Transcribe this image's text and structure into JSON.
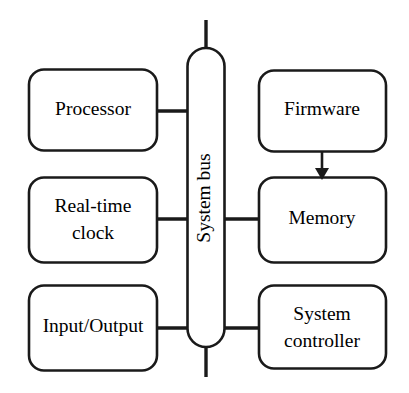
{
  "diagram": {
    "colors": {
      "stroke": "#1a1a1a",
      "fill": "#ffffff",
      "text": "#000000",
      "background": "#ffffff"
    },
    "bus": {
      "label": "System bus",
      "orientation": "vertical",
      "label_rotation_degrees": -90
    },
    "nodes": {
      "processor": {
        "label": "Processor",
        "side": "left",
        "row": 1
      },
      "real_time_clock": {
        "label_line1": "Real-time",
        "label_line2": "clock",
        "side": "left",
        "row": 2
      },
      "input_output": {
        "label": "Input/Output",
        "side": "left",
        "row": 3
      },
      "firmware": {
        "label": "Firmware",
        "side": "right",
        "row": 1
      },
      "memory": {
        "label": "Memory",
        "side": "right",
        "row": 2
      },
      "system_controller": {
        "label_line1": "System",
        "label_line2": "controller",
        "side": "right",
        "row": 3
      }
    },
    "connections": [
      {
        "from": "processor",
        "to": "bus",
        "type": "line"
      },
      {
        "from": "real_time_clock",
        "to": "bus",
        "type": "line"
      },
      {
        "from": "input_output",
        "to": "bus",
        "type": "line"
      },
      {
        "from": "bus",
        "to": "memory",
        "type": "line"
      },
      {
        "from": "bus",
        "to": "system_controller",
        "type": "line"
      },
      {
        "from": "firmware",
        "to": "memory",
        "type": "arrow"
      },
      {
        "from": "bus",
        "to": "top-external",
        "type": "stub"
      },
      {
        "from": "bus",
        "to": "bottom-external",
        "type": "stub"
      }
    ]
  }
}
